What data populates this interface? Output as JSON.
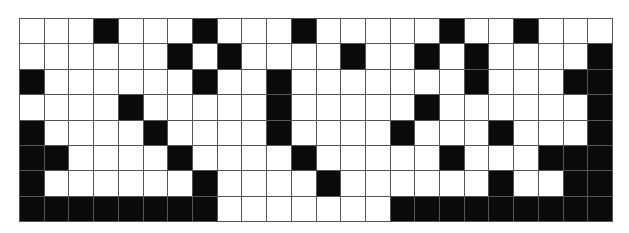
{
  "puzzle": {
    "type": "black-white cell grid",
    "cols": 24,
    "rows": 8,
    "cells": [
      "000100010001000001001000",
      "000000101000010010100001",
      "100000010010000000100011",
      "000010000010000010000001",
      "100001000010000100010001",
      "110000100001000001000111",
      "100000010000100000010011",
      "111111110000000111111111"
    ],
    "colors": {
      "filled": "#0a0a0a",
      "empty": "#ffffff",
      "gridline": "#555555"
    }
  }
}
